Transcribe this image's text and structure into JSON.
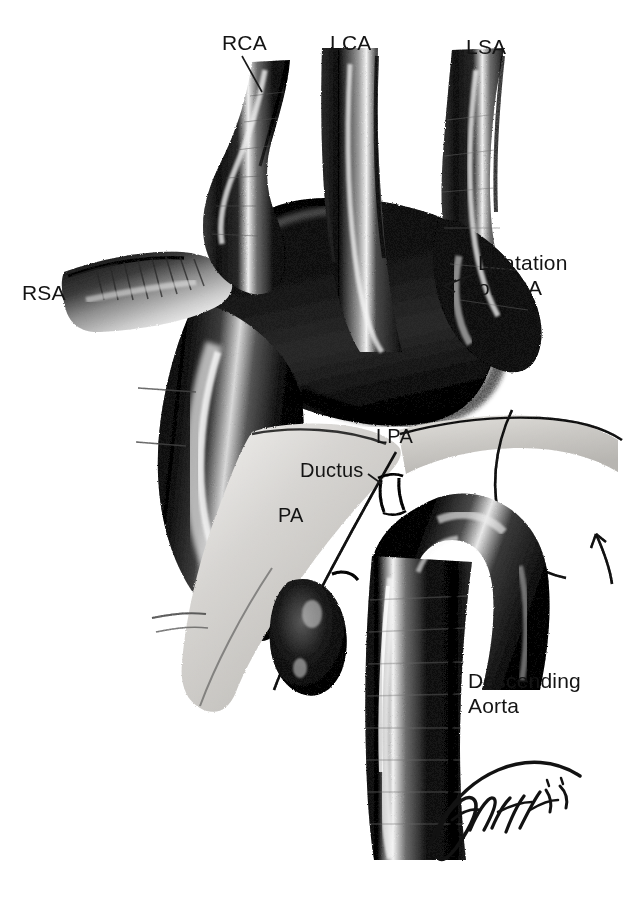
{
  "figure": {
    "kind": "medical-illustration",
    "technique": "pen-and-ink stipple drawing",
    "background_color": "#ffffff",
    "ink_color": "#141414"
  },
  "labels": [
    {
      "id": "rsa",
      "text": "RSA",
      "x": 22,
      "y": 280,
      "leader": true
    },
    {
      "id": "rca",
      "text": "RCA",
      "x": 222,
      "y": 30,
      "leader": true
    },
    {
      "id": "lca",
      "text": "LCA",
      "x": 330,
      "y": 30,
      "leader": false
    },
    {
      "id": "lsa",
      "text": "LSA",
      "x": 466,
      "y": 34,
      "leader": false
    },
    {
      "id": "dilatation",
      "text": "Dilatation\nof LSA",
      "x": 478,
      "y": 250,
      "leader": true
    },
    {
      "id": "lpa",
      "text": "LPA",
      "x": 376,
      "y": 424,
      "leader": false
    },
    {
      "id": "ductus",
      "text": "Ductus",
      "x": 300,
      "y": 458,
      "leader": true
    },
    {
      "id": "pa",
      "text": "PA",
      "x": 278,
      "y": 503,
      "leader": false
    },
    {
      "id": "descending",
      "text": "Descending\nAorta",
      "x": 468,
      "y": 668,
      "leader": false
    }
  ],
  "label_glossary": {
    "RSA": "Right subclavian artery",
    "RCA": "Right carotid artery",
    "LCA": "Left carotid artery",
    "LSA": "Left subclavian artery",
    "LPA": "Left pulmonary artery",
    "PA": "Pulmonary artery",
    "Ductus": "Ductus arteriosus",
    "Descending Aorta": "Descending thoracic aorta"
  },
  "signature": {
    "artist_mark": "Fiwoff",
    "year": "'81",
    "x": 430,
    "y": 770
  }
}
